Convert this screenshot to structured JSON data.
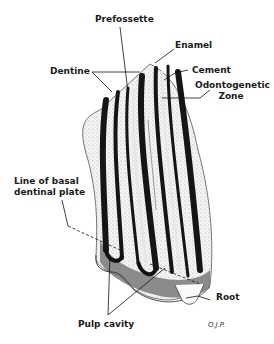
{
  "figure": {
    "signature": "O.J.P.",
    "labels": {
      "prefossette": "Prefossette",
      "enamel": "Enamel",
      "dentine": "Dentine",
      "cement": "Cement",
      "odontogenetic_line1": "Odontogenetic",
      "odontogenetic_line2": "Zone",
      "basal_line1": "Line of basal",
      "basal_line2": "dentinal plate",
      "root": "Root",
      "pulp_cavity": "Pulp cavity"
    }
  },
  "colors": {
    "ink": "#111111",
    "stipple": "#d9d9d9",
    "mid_gray": "#7a7a7a",
    "background": "#ffffff"
  }
}
